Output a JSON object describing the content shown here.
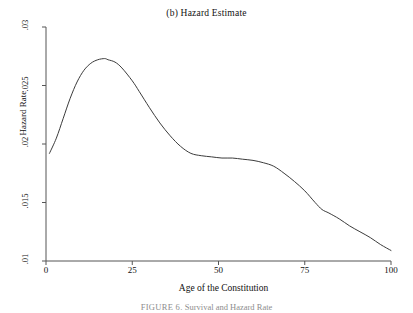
{
  "chart_data": {
    "type": "line",
    "title": "(b) Hazard Estimate",
    "subtitle": "",
    "xlabel": "Age of the Constitution",
    "ylabel": "Hazard Rate",
    "xlim": [
      0,
      100
    ],
    "ylim": [
      0.01,
      0.03
    ],
    "xticks": [
      "0",
      "25",
      "50",
      "75",
      "100"
    ],
    "xtick_values": [
      0,
      25,
      50,
      75,
      100
    ],
    "yticks": [
      ".01",
      ".015",
      ".02",
      ".025",
      ".03"
    ],
    "ytick_values": [
      0.01,
      0.015,
      0.02,
      0.025,
      0.03
    ],
    "grid": false,
    "legend": false,
    "legend_position": "none",
    "line_color": "#3b3b3b",
    "line_width": 1.0,
    "series": [
      {
        "name": "Hazard Rate",
        "x": [
          1,
          3,
          5,
          7,
          9,
          11,
          13,
          15,
          17,
          18,
          20,
          22,
          25,
          27,
          30,
          33,
          36,
          39,
          42,
          45,
          48,
          51,
          54,
          57,
          60,
          63,
          66,
          69,
          72,
          75,
          78,
          80,
          82,
          85,
          88,
          91,
          94,
          97,
          100
        ],
        "values": [
          0.0192,
          0.0205,
          0.0222,
          0.0239,
          0.0253,
          0.0263,
          0.0269,
          0.0272,
          0.0273,
          0.0272,
          0.027,
          0.0265,
          0.0254,
          0.0245,
          0.0231,
          0.0218,
          0.0207,
          0.0198,
          0.0192,
          0.019,
          0.0189,
          0.0188,
          0.0188,
          0.0187,
          0.0186,
          0.0184,
          0.0181,
          0.0175,
          0.0168,
          0.016,
          0.015,
          0.0144,
          0.0141,
          0.0136,
          0.013,
          0.0125,
          0.012,
          0.0114,
          0.0109
        ]
      }
    ],
    "annotations": []
  },
  "figure": {
    "caption_label": "FIGURE 6.",
    "caption_text": "Survival and Hazard Rate"
  }
}
